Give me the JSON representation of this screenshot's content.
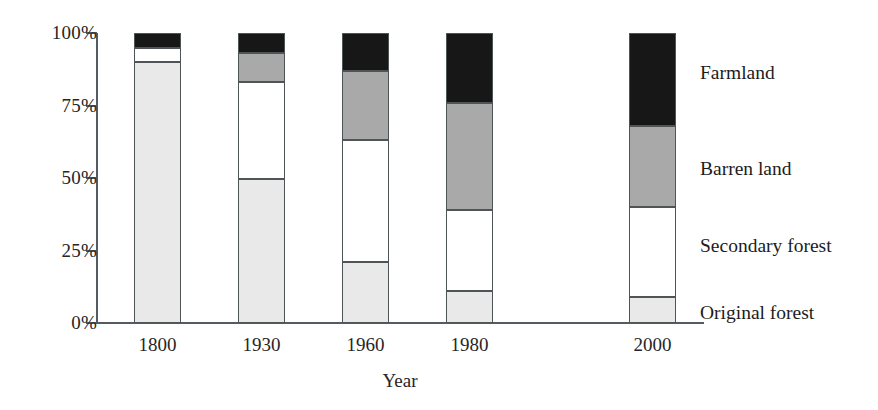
{
  "chart_data": {
    "type": "bar",
    "subtype": "stacked-100-percent",
    "title": "",
    "xlabel": "Year",
    "ylabel": "",
    "categories": [
      "1800",
      "1930",
      "1960",
      "1980",
      "2000"
    ],
    "ylim": [
      0,
      100
    ],
    "ytick_labels": [
      "0%",
      "25%",
      "50%",
      "75%",
      "100%"
    ],
    "ytick_values": [
      0,
      25,
      50,
      75,
      100
    ],
    "grid": false,
    "legend_position": "right",
    "series": [
      {
        "name": "Original forest",
        "color": "#e9e9e9",
        "values": [
          90,
          49.5,
          21,
          11,
          9
        ]
      },
      {
        "name": "Secondary forest",
        "color": "#ffffff",
        "values": [
          5,
          33.5,
          42,
          28,
          31
        ]
      },
      {
        "name": "Barren land",
        "color": "#a9a9a9",
        "values": [
          0,
          10,
          24,
          37,
          28
        ]
      },
      {
        "name": "Farmland",
        "color": "#171717",
        "values": [
          5,
          7,
          13,
          24,
          32
        ]
      }
    ],
    "legend_entries": [
      {
        "label": "Farmland",
        "color": "#171717"
      },
      {
        "label": "Barren land",
        "color": "#a9a9a9"
      },
      {
        "label": "Secondary forest",
        "color": "#ffffff"
      },
      {
        "label": "Original forest",
        "color": "#e9e9e9"
      }
    ]
  }
}
